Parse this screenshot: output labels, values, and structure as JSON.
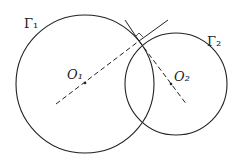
{
  "labels": {
    "gamma1": "Γ₁",
    "gamma2": "Γ₂",
    "o1": "O₁",
    "o2": "O₂"
  },
  "geometry": {
    "circle1": {
      "cx": 85,
      "cy": 84,
      "r": 69
    },
    "circle2": {
      "cx": 176,
      "cy": 84,
      "r": 52
    },
    "intersection": {
      "x": 139,
      "y": 41
    }
  },
  "colors": {
    "stroke": "#222222"
  }
}
